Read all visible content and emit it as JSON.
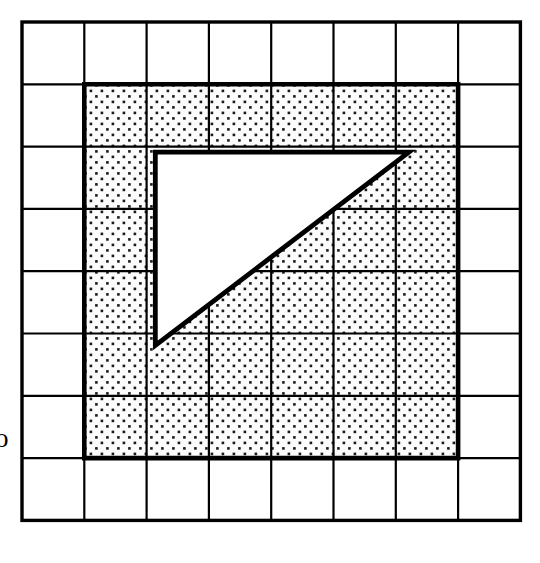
{
  "figure": {
    "type": "geometry-diagram",
    "background_color": "#ffffff",
    "ink_color": "#000000",
    "fill_pattern": "dotted",
    "edge_label": "o"
  },
  "grid": {
    "columns": 8,
    "rows": 8,
    "origin_x": 22,
    "origin_y": 22,
    "cell_size": 62.3,
    "thin_line_width": 2.2,
    "outer_line_width": 3.4,
    "line_color": "#000000"
  },
  "shaded_region": {
    "name": "dotted-square",
    "shape": "square",
    "col_start": 1,
    "col_end": 7,
    "row_start": 1,
    "row_end": 7,
    "width_cells": 6,
    "height_cells": 6,
    "area_cells": 36,
    "fill": "dotted",
    "border_width": 4.6,
    "border_color": "#000000",
    "dot_spacing": 11,
    "dot_size": 2.6,
    "dot_color": "#1a1a1a",
    "background": "#fcfcfc"
  },
  "triangle": {
    "name": "white-right-triangle",
    "shape": "right-triangle",
    "fill": "#ffffff",
    "stroke": "#000000",
    "stroke_width": 4.8,
    "legs_cells": {
      "horizontal": 4.1,
      "vertical": 3.1
    },
    "area_cells": 6.4,
    "vertices_cells": [
      {
        "name": "top-left-vertex",
        "col": 2.14,
        "row": 2.09
      },
      {
        "name": "top-right-vertex",
        "col": 6.21,
        "row": 2.09
      },
      {
        "name": "bottom-left-vertex",
        "col": 2.14,
        "row": 5.19
      }
    ]
  }
}
